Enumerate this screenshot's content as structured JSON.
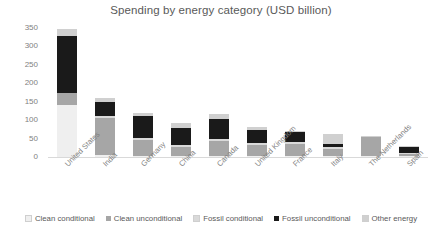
{
  "chart_data": {
    "type": "bar",
    "stacked": true,
    "title": "Spending by energy category (USD billion)",
    "xlabel": "",
    "ylabel": "",
    "ylim": [
      0,
      350
    ],
    "yticks": [
      0,
      50,
      100,
      150,
      200,
      250,
      300,
      350
    ],
    "grid": false,
    "legend_position": "bottom",
    "categories": [
      "United States",
      "India",
      "Germany",
      "China",
      "Canada",
      "United Kingdom",
      "France",
      "Italy",
      "The Netherlands",
      "Spain"
    ],
    "series": [
      {
        "name": "Clean conditional",
        "color": "#efefef",
        "values": [
          140,
          5,
          3,
          2,
          2,
          2,
          1,
          1,
          1,
          1
        ]
      },
      {
        "name": "Clean unconditional",
        "color": "#a6a6a6",
        "values": [
          35,
          100,
          42,
          24,
          40,
          30,
          33,
          20,
          52,
          5
        ]
      },
      {
        "name": "Fossil conditional",
        "color": "#d9d9d9",
        "values": [
          0,
          6,
          8,
          5,
          7,
          5,
          5,
          4,
          0,
          1
        ]
      },
      {
        "name": "Fossil unconditional",
        "color": "#1a1a1a",
        "values": [
          153,
          38,
          58,
          48,
          54,
          37,
          26,
          9,
          0,
          17
        ]
      },
      {
        "name": "Other energy",
        "color": "#d0d0d0",
        "values": [
          20,
          11,
          9,
          12,
          12,
          6,
          5,
          26,
          2,
          1
        ]
      }
    ],
    "totals": [
      348,
      160,
      120,
      91,
      115,
      80,
      70,
      60,
      55,
      25
    ]
  },
  "legend": {
    "items": [
      {
        "label": "Clean conditional",
        "color": "#efefef"
      },
      {
        "label": "Clean unconditional",
        "color": "#a6a6a6"
      },
      {
        "label": "Fossil conditional",
        "color": "#d9d9d9"
      },
      {
        "label": "Fossil unconditional",
        "color": "#1a1a1a"
      },
      {
        "label": "Other energy",
        "color": "#d0d0d0"
      }
    ]
  }
}
